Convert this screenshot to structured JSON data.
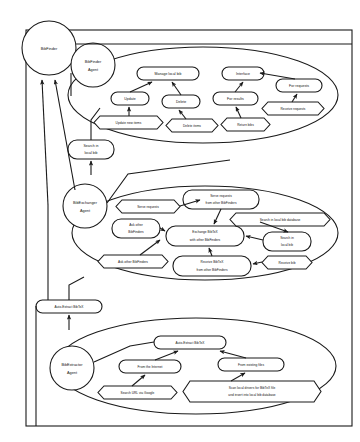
{
  "diagram": {
    "type": "uml-use-case-diagram",
    "colors": {
      "stroke": "#1a1a1a",
      "fill": "#ffffff",
      "text": "#111111"
    },
    "system_boundary": {
      "label": ""
    },
    "actors": [
      {
        "id": "bibfinder",
        "label": "BibFinder"
      }
    ],
    "agents": [
      {
        "id": "bibfinder-agent",
        "line1": "BibFinder",
        "line2": "Agent"
      },
      {
        "id": "bibexchanger-agent",
        "line1": "BibExchanger",
        "line2": "Agent"
      },
      {
        "id": "bibextractor-agent",
        "line1": "BibExtractor",
        "line2": "Agent"
      }
    ],
    "groups": [
      {
        "id": "group-bibfinder-agent",
        "label": ""
      },
      {
        "id": "group-bibexchanger-agent",
        "label": ""
      },
      {
        "id": "group-bibextractor-agent",
        "label": ""
      }
    ],
    "use_cases": [
      {
        "id": "manage-local-bib",
        "label": "Manage local bib"
      },
      {
        "id": "interface",
        "label": "Interface"
      },
      {
        "id": "for-requests",
        "label": "For requests"
      },
      {
        "id": "update",
        "label": "Update"
      },
      {
        "id": "delete",
        "label": "Delete"
      },
      {
        "id": "for-results",
        "label": "For results"
      },
      {
        "id": "search-in-local-bib-1",
        "line1": "Search in",
        "line2": "local bib"
      },
      {
        "id": "serve-requests-from",
        "line1": "Serve requests",
        "line2": "from other BibFinders"
      },
      {
        "id": "ask-other-bibfinders-uc",
        "line1": "Ask other",
        "line2": "BibFinders"
      },
      {
        "id": "exchange-bibtex",
        "line1": "Exchange BibTeX",
        "line2": "with other BibFinders"
      },
      {
        "id": "search-in-local-bib-2",
        "line1": "Search in",
        "line2": "local bib"
      },
      {
        "id": "receive-bibtex-from",
        "line1": "Receive BibTeX",
        "line2": "from other BibFinders"
      },
      {
        "id": "auto-extract-bibtex-1",
        "label": "Auto-Extract BibTeX"
      },
      {
        "id": "auto-extract-bibtex-2",
        "label": "Auto-Extract BibTeX"
      },
      {
        "id": "from-the-internet",
        "label": "From the Internet"
      },
      {
        "id": "from-existing-files",
        "label": "From existing files"
      }
    ],
    "actions": [
      {
        "id": "update-new-items",
        "label": "Update new items"
      },
      {
        "id": "delete-items",
        "label": "Delete items"
      },
      {
        "id": "return-bibs",
        "label": "Return bibs"
      },
      {
        "id": "receive-requests",
        "label": "Receive requests"
      },
      {
        "id": "serve-requests",
        "label": "Serve requests"
      },
      {
        "id": "search-local-db",
        "label": "Search in local bib database"
      },
      {
        "id": "ask-other-bibfinders-act",
        "label": "Ask other BibFinders"
      },
      {
        "id": "receive-bib",
        "label": "Receive bib"
      },
      {
        "id": "search-url-google",
        "label": "Search URL via Google"
      },
      {
        "id": "scan-local-drivers",
        "line1": "Scan local drivers for BibTeX file",
        "line2": "and insert into local bib database"
      }
    ]
  }
}
